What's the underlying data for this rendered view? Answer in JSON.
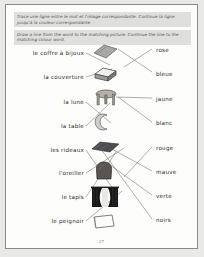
{
  "worksheet": {
    "instruction_fr": "Trace une ligne entre le mot et l'image correspondante. Continue la ligne jusqu'à la couleur correspondante.",
    "instruction_en": "Draw a line from the word to the matching picture. Continue the line to the matching colour word.",
    "page_number": "27",
    "colors": {
      "page_background": "#fdfdfc",
      "border": "#8a8a86",
      "instruction_background": "#dfdfdd",
      "text": "#2a2a28",
      "line": "#7b7b76",
      "outside": "#e9e9e7"
    },
    "french_words": [
      {
        "label": "le coffre à bijoux",
        "x": 78,
        "y": 48
      },
      {
        "label": "la couverture",
        "x": 78,
        "y": 72
      },
      {
        "label": "la lune",
        "x": 78,
        "y": 97
      },
      {
        "label": "la table",
        "x": 78,
        "y": 121
      },
      {
        "label": "les rideaux",
        "x": 78,
        "y": 145
      },
      {
        "label": "l'oreiller",
        "x": 78,
        "y": 168
      },
      {
        "label": "le tapis",
        "x": 78,
        "y": 192
      },
      {
        "label": "le peignoir",
        "x": 78,
        "y": 216
      }
    ],
    "colour_words": [
      {
        "label": "rose",
        "x": 150,
        "y": 45
      },
      {
        "label": "bleue",
        "x": 150,
        "y": 69
      },
      {
        "label": "jaune",
        "x": 150,
        "y": 94
      },
      {
        "label": "blanc",
        "x": 150,
        "y": 118
      },
      {
        "label": "rouge",
        "x": 150,
        "y": 143
      },
      {
        "label": "mauve",
        "x": 150,
        "y": 167
      },
      {
        "label": "verte",
        "x": 150,
        "y": 191
      },
      {
        "label": "noirs",
        "x": 150,
        "y": 215
      }
    ],
    "pictures": [
      {
        "name": "blanket-picture",
        "x": 86,
        "y": 38
      },
      {
        "name": "jewellery-box-picture",
        "x": 86,
        "y": 60
      },
      {
        "name": "table-picture",
        "x": 88,
        "y": 84
      },
      {
        "name": "moon-picture",
        "x": 88,
        "y": 108
      },
      {
        "name": "rug-picture",
        "x": 84,
        "y": 133
      },
      {
        "name": "pillow-picture",
        "x": 88,
        "y": 156
      },
      {
        "name": "curtains-picture",
        "x": 84,
        "y": 181
      },
      {
        "name": "bathrobe-picture",
        "x": 86,
        "y": 208
      }
    ],
    "connector_lines": [
      {
        "x1": 80,
        "y1": 48,
        "x2": 104,
        "y2": 60
      },
      {
        "x1": 112,
        "y1": 44,
        "x2": 146,
        "y2": 67
      },
      {
        "x1": 80,
        "y1": 72,
        "x2": 106,
        "y2": 64
      },
      {
        "x1": 118,
        "y1": 62,
        "x2": 146,
        "y2": 44
      },
      {
        "x1": 80,
        "y1": 97,
        "x2": 105,
        "y2": 118
      },
      {
        "x1": 112,
        "y1": 92,
        "x2": 146,
        "y2": 117
      },
      {
        "x1": 80,
        "y1": 121,
        "x2": 104,
        "y2": 98
      },
      {
        "x1": 110,
        "y1": 92,
        "x2": 146,
        "y2": 93
      },
      {
        "x1": 80,
        "y1": 145,
        "x2": 112,
        "y2": 191
      },
      {
        "x1": 104,
        "y1": 143,
        "x2": 146,
        "y2": 166
      },
      {
        "x1": 80,
        "y1": 168,
        "x2": 118,
        "y2": 143
      },
      {
        "x1": 104,
        "y1": 160,
        "x2": 146,
        "y2": 190
      },
      {
        "x1": 80,
        "y1": 192,
        "x2": 110,
        "y2": 147
      },
      {
        "x1": 92,
        "y1": 140,
        "x2": 146,
        "y2": 214
      },
      {
        "x1": 80,
        "y1": 216,
        "x2": 116,
        "y2": 186
      },
      {
        "x1": 118,
        "y1": 172,
        "x2": 146,
        "y2": 142
      }
    ]
  }
}
